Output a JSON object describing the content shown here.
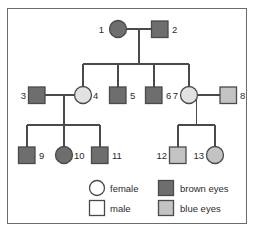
{
  "figure": {
    "type": "pedigree-chart",
    "title": "",
    "border_color": "#6c6c6c",
    "background": "#ffffff",
    "line_color": "#4a4a4a"
  },
  "colors": {
    "brown_eyes_fill": "#6e6e6e",
    "blue_eyes_fill": "#c3c3c3",
    "unaffected_fill": "#ffffff",
    "outline": "#4a4a4a",
    "text": "#2b2b2b"
  },
  "legend": {
    "items": [
      {
        "key": "female",
        "label": "female",
        "shape": "circle",
        "fill": "#ffffff"
      },
      {
        "key": "male",
        "label": "male",
        "shape": "square",
        "fill": "#ffffff"
      },
      {
        "key": "brown_eyes",
        "label": "brown eyes",
        "shape": "square",
        "fill": "#6e6e6e"
      },
      {
        "key": "blue_eyes",
        "label": "blue eyes",
        "shape": "square",
        "fill": "#c3c3c3"
      }
    ]
  },
  "individuals": [
    {
      "id": "1",
      "number": "1",
      "sex": "female",
      "shape": "circle",
      "trait": "brown eyes",
      "fill": "#6e6e6e",
      "generation": 1,
      "cx": 118,
      "cy": 29,
      "label_x": 104,
      "label_y": 32,
      "label_anchor": "end"
    },
    {
      "id": "2",
      "number": "2",
      "sex": "male",
      "shape": "square",
      "trait": "brown eyes",
      "fill": "#6e6e6e",
      "generation": 1,
      "cx": 160,
      "cy": 29,
      "label_x": 174,
      "label_y": 32,
      "label_anchor": "start"
    },
    {
      "id": "3",
      "number": "3",
      "sex": "male",
      "shape": "square",
      "trait": "brown eyes",
      "fill": "#6e6e6e",
      "generation": 2,
      "cx": 37,
      "cy": 95,
      "label_x": 24,
      "label_y": 98,
      "label_anchor": "end"
    },
    {
      "id": "4",
      "number": "4",
      "sex": "female",
      "shape": "circle",
      "trait": "unaffected",
      "fill": "#e2e2e2",
      "generation": 2,
      "cx": 83,
      "cy": 95,
      "label_x": 96,
      "label_y": 98,
      "label_anchor": "start"
    },
    {
      "id": "5",
      "number": "5",
      "sex": "male",
      "shape": "square",
      "trait": "brown eyes",
      "fill": "#6e6e6e",
      "generation": 2,
      "cx": 118,
      "cy": 95,
      "label_x": 131,
      "label_y": 98,
      "label_anchor": "start"
    },
    {
      "id": "6",
      "number": "6",
      "sex": "male",
      "shape": "square",
      "trait": "brown eyes",
      "fill": "#6e6e6e",
      "generation": 2,
      "cx": 154,
      "cy": 95,
      "label_x": 167,
      "label_y": 98,
      "label_anchor": "start"
    },
    {
      "id": "7",
      "number": "7",
      "sex": "female",
      "shape": "circle",
      "trait": "unaffected",
      "fill": "#e2e2e2",
      "generation": 2,
      "cx": 189,
      "cy": 95,
      "label_x": 176,
      "label_y": 98,
      "label_anchor": "end"
    },
    {
      "id": "8",
      "number": "8",
      "sex": "male",
      "shape": "square",
      "trait": "blue eyes",
      "fill": "#c3c3c3",
      "generation": 2,
      "cx": 228,
      "cy": 95,
      "label_x": 241,
      "label_y": 98,
      "label_anchor": "start"
    },
    {
      "id": "9",
      "number": "9",
      "sex": "male",
      "shape": "square",
      "trait": "brown eyes",
      "fill": "#6e6e6e",
      "generation": 3,
      "cx": 27,
      "cy": 155,
      "label_x": 40,
      "label_y": 158,
      "label_anchor": "start"
    },
    {
      "id": "10",
      "number": "10",
      "sex": "female",
      "shape": "circle",
      "trait": "brown eyes",
      "fill": "#6e6e6e",
      "generation": 3,
      "cx": 64,
      "cy": 155,
      "label_x": 77,
      "label_y": 158,
      "label_anchor": "start"
    },
    {
      "id": "11",
      "number": "11",
      "sex": "male",
      "shape": "square",
      "trait": "brown eyes",
      "fill": "#6e6e6e",
      "generation": 3,
      "cx": 100,
      "cy": 155,
      "label_x": 113,
      "label_y": 158,
      "label_anchor": "start"
    },
    {
      "id": "12",
      "number": "12",
      "sex": "male",
      "shape": "square",
      "trait": "blue eyes",
      "fill": "#c3c3c3",
      "generation": 3,
      "cx": 178,
      "cy": 155,
      "label_x": 165,
      "label_y": 158,
      "label_anchor": "end"
    },
    {
      "id": "13",
      "number": "13",
      "sex": "female",
      "shape": "circle",
      "trait": "blue eyes",
      "fill": "#c3c3c3",
      "generation": 3,
      "cx": 215,
      "cy": 155,
      "label_x": 202,
      "label_y": 158,
      "label_anchor": "end"
    }
  ],
  "matings": [
    {
      "id": "mating-1-2",
      "partners": [
        "1",
        "2"
      ],
      "children": [
        "4",
        "5",
        "6",
        "7"
      ]
    },
    {
      "id": "mating-3-4",
      "partners": [
        "3",
        "4"
      ],
      "children": [
        "9",
        "10",
        "11"
      ]
    },
    {
      "id": "mating-7-8",
      "partners": [
        "7",
        "8"
      ],
      "children": [
        "12",
        "13"
      ]
    }
  ]
}
